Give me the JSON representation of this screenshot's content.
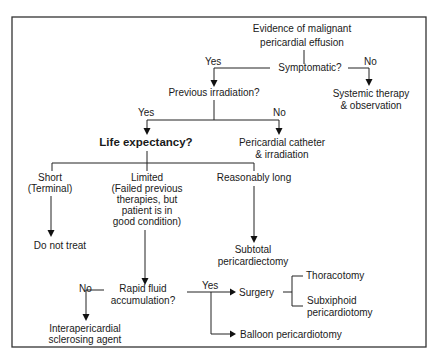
{
  "diagram": {
    "type": "decision-flowchart",
    "nodes": {
      "start": [
        "Evidence of malignant",
        "pericardial effusion"
      ],
      "symptomatic": "Symptomatic?",
      "systemic": [
        "Systemic therapy",
        "& observation"
      ],
      "irradiation": "Previous irradiation?",
      "life": "Life expectancy?",
      "catheter": [
        "Pericardial catheter",
        "& irradiation"
      ],
      "short": [
        "Short",
        "(Terminal)"
      ],
      "limited": [
        "Limited",
        "(Failed previous",
        "therapies, but",
        "patient is in",
        "good condition)"
      ],
      "long": "Reasonably long",
      "donottreat": "Do not treat",
      "subtotal": [
        "Subtotal",
        "pericardiectomy"
      ],
      "rapid": [
        "Rapid fluid",
        "accumulation?"
      ],
      "surgery": "Surgery",
      "thoracotomy": "Thoracotomy",
      "subxiphoid": [
        "Subxiphoid",
        "pericardiotomy"
      ],
      "balloon": "Balloon pericardiotomy",
      "sclerosing": [
        "Interapericardial",
        "sclerosing agent"
      ]
    },
    "labels": {
      "yes1": "Yes",
      "no1": "No",
      "yes2": "Yes",
      "no2": "No",
      "yes3": "Yes",
      "no3": "No"
    },
    "edges": [
      {
        "from": "start",
        "to": "symptomatic"
      },
      {
        "from": "symptomatic",
        "to": "irradiation",
        "label": "Yes"
      },
      {
        "from": "symptomatic",
        "to": "systemic",
        "label": "No"
      },
      {
        "from": "irradiation",
        "to": "life",
        "label": "Yes"
      },
      {
        "from": "irradiation",
        "to": "catheter",
        "label": "No"
      },
      {
        "from": "life",
        "to": "short"
      },
      {
        "from": "life",
        "to": "limited"
      },
      {
        "from": "life",
        "to": "long"
      },
      {
        "from": "short",
        "to": "donottreat"
      },
      {
        "from": "long",
        "to": "subtotal"
      },
      {
        "from": "limited",
        "to": "rapid"
      },
      {
        "from": "rapid",
        "to": "sclerosing",
        "label": "No"
      },
      {
        "from": "rapid",
        "to": "surgery",
        "label": "Yes"
      },
      {
        "from": "rapid",
        "to": "balloon",
        "label": "Yes"
      },
      {
        "from": "surgery",
        "to": "thoracotomy"
      },
      {
        "from": "surgery",
        "to": "subxiphoid"
      }
    ]
  }
}
